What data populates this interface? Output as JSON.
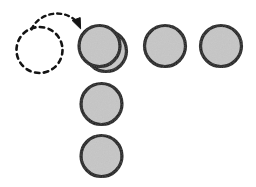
{
  "figure": {
    "type": "diagram",
    "title": "",
    "background_color": "#ffffff",
    "width": 256,
    "height": 187
  },
  "style": {
    "disk_fill": "#c6c6c6",
    "disk_stroke": "#111111",
    "disk_stroke_width": 3.2,
    "ghost_stroke": "#141414",
    "ghost_stroke_width": 2.6,
    "ghost_dash": "4.5 4.5",
    "arrow_stroke": "#141414",
    "arrow_stroke_width": 2.4,
    "arrow_dash": "4 4"
  },
  "elements": {
    "ghost_circle": {
      "label": "ghost-source-circle",
      "cx": 39.5,
      "cy": 50,
      "r": 23,
      "filled": false,
      "dashed": true
    },
    "move_arrow": {
      "label": "move-arrow",
      "dashed": true,
      "path": "M 31.5 29.5 C 38 12.5 66 6.5 79 24.5",
      "head": {
        "tip_x": 80.5,
        "tip_y": 28.5,
        "points": "72.2,20.6 80.6,28.8 80.2,17.6"
      }
    },
    "disks": [
      {
        "label": "disk-back-stack",
        "group": "top-row",
        "index": 0,
        "cx": 106,
        "cy": 51,
        "r": 20.5,
        "z": 1
      },
      {
        "label": "disk-top-row-1",
        "group": "top-row",
        "index": 1,
        "cx": 99.5,
        "cy": 46,
        "r": 20.5,
        "z": 2
      },
      {
        "label": "disk-top-row-2",
        "group": "top-row",
        "index": 2,
        "cx": 165,
        "cy": 46,
        "r": 20.5,
        "z": 2
      },
      {
        "label": "disk-top-row-3",
        "group": "top-row",
        "index": 3,
        "cx": 221,
        "cy": 46,
        "r": 20.5,
        "z": 2
      },
      {
        "label": "disk-column-1",
        "group": "column",
        "index": 1,
        "cx": 101.5,
        "cy": 104,
        "r": 20.5,
        "z": 2
      },
      {
        "label": "disk-column-2",
        "group": "column",
        "index": 2,
        "cx": 101.5,
        "cy": 156,
        "r": 20.5,
        "z": 2
      }
    ]
  },
  "counts": {
    "solid_disks": 6,
    "ghost_circles": 1,
    "arrows": 1
  }
}
